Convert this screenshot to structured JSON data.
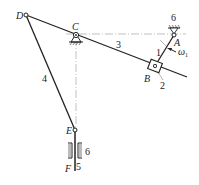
{
  "points": {
    "A": {
      "label": "A"
    },
    "B": {
      "label": "B"
    },
    "C": {
      "label": "C"
    },
    "D": {
      "label": "D"
    },
    "E": {
      "label": "E"
    },
    "F": {
      "label": "F"
    }
  },
  "links": {
    "crank": "1",
    "slider_block": "2",
    "rocker": "3",
    "connecting_rod": "4",
    "output_slider": "5",
    "frame_top": "6",
    "frame_guide": "6"
  },
  "angular_velocity": {
    "symbol": "ω",
    "subscript": "1"
  },
  "colors": {
    "line": "#222222",
    "center_line": "#888888",
    "background": "#ffffff"
  }
}
